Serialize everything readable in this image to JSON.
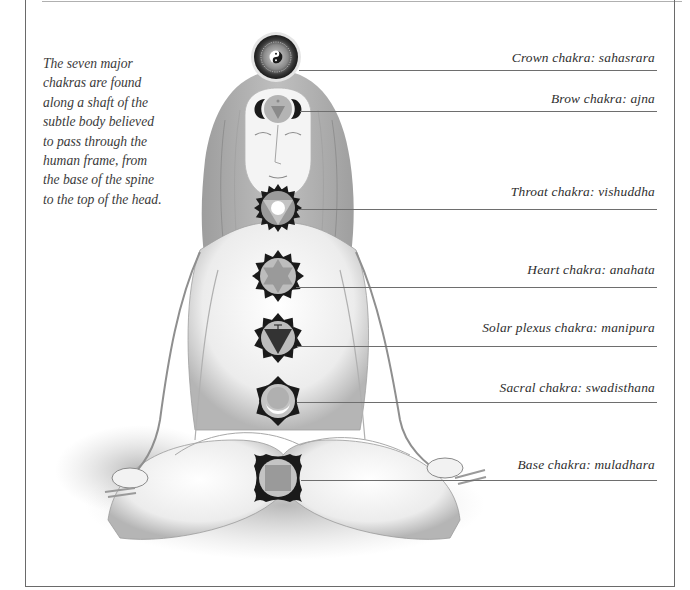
{
  "intro_text": {
    "lines": [
      "The seven major",
      "chakras are found",
      "along a shaft of the",
      "subtle body believed",
      "to pass through the",
      "human frame, from",
      "the base of the spine",
      "to the top of the head."
    ]
  },
  "chakras": [
    {
      "label": "Crown chakra: sahasrara",
      "symbol": "yin-yang-lotus"
    },
    {
      "label": "Brow chakra: ajna",
      "symbol": "two-petal-triangle"
    },
    {
      "label": "Throat chakra: vishuddha",
      "symbol": "circle-in-triangle"
    },
    {
      "label": "Heart chakra: anahata",
      "symbol": "hexagram"
    },
    {
      "label": "Solar plexus chakra: manipura",
      "symbol": "inverted-triangle"
    },
    {
      "label": "Sacral chakra: swadisthana",
      "symbol": "crescent-moon"
    },
    {
      "label": "Base chakra: muladhara",
      "symbol": "square"
    }
  ],
  "colors": {
    "symbol_dark": "#1a1a1a",
    "symbol_mid": "#9a9a9a",
    "symbol_light": "#c4c4c4",
    "frame": "#6a6a6a",
    "text": "#2e2e2e"
  }
}
